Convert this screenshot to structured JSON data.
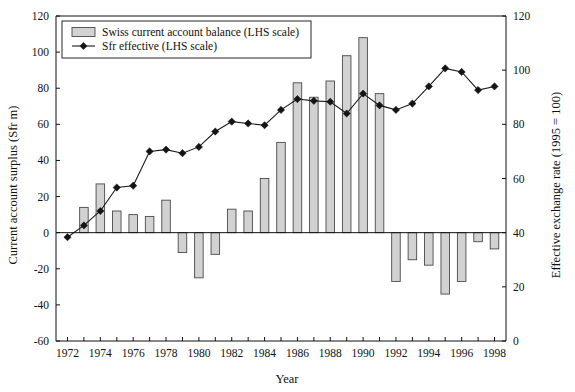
{
  "chart_data": {
    "type": "bar",
    "title": "",
    "xlabel": "Year",
    "ylabel": "Current account surplus (Sfr m)",
    "y2label": "Effective exchange rate (1995 = 100)",
    "grid": false,
    "legend_position": "top-left",
    "xlim": [
      1971.3,
      1998.7
    ],
    "ylim": [
      -60,
      120
    ],
    "y2lim": [
      0,
      120
    ],
    "x_tick_labels": [
      "1972",
      "1974",
      "1976",
      "1978",
      "1980",
      "1982",
      "1984",
      "1986",
      "1988",
      "1990",
      "1992",
      "1994",
      "1996",
      "1998"
    ],
    "x_tick_values": [
      1972,
      1974,
      1976,
      1978,
      1980,
      1982,
      1984,
      1986,
      1988,
      1990,
      1992,
      1994,
      1996,
      1998
    ],
    "y_tick_labels": [
      "120",
      "100",
      "80",
      "60",
      "40",
      "20",
      "0",
      "-20",
      "-40",
      "-60"
    ],
    "y_tick_values": [
      120,
      100,
      80,
      60,
      40,
      20,
      0,
      -20,
      -40,
      -60
    ],
    "y2_tick_labels": [
      "120",
      "100",
      "80",
      "60",
      "40",
      "20",
      "0"
    ],
    "y2_tick_values": [
      120,
      100,
      80,
      60,
      40,
      20,
      0
    ],
    "x": [
      1972,
      1973,
      1974,
      1975,
      1976,
      1977,
      1978,
      1979,
      1980,
      1981,
      1982,
      1983,
      1984,
      1985,
      1986,
      1987,
      1988,
      1989,
      1990,
      1991,
      1992,
      1993,
      1994,
      1995,
      1996,
      1997,
      1998
    ],
    "series": [
      {
        "name": "Swiss current account balance (LHS scale)",
        "type": "bar",
        "color": "#d2d2d2",
        "edge_color": "#4a4a4a",
        "values": [
          0,
          14,
          27,
          12,
          10,
          9,
          18,
          -11,
          -25,
          -12,
          13,
          12,
          30,
          50,
          83,
          75,
          84,
          98,
          108,
          77,
          -27,
          -15,
          -18,
          -34,
          -27,
          -5,
          -9
        ]
      },
      {
        "name": "Sfr effective (LHS scale)",
        "type": "line",
        "color": "#141414",
        "marker": "diamond",
        "values": [
          -2.5,
          4,
          12,
          25,
          26,
          45,
          46,
          44,
          47.5,
          56,
          61.5,
          60.5,
          59.5,
          68,
          74,
          73,
          72.5,
          66,
          77,
          70.5,
          68,
          71.5,
          81,
          91,
          89,
          79,
          81
        ]
      }
    ],
    "legend_entries": [
      "Swiss current account balance (LHS scale)",
      "Sfr effective (LHS scale)"
    ]
  },
  "legend": {
    "bar_label": "Swiss current account balance (LHS scale)",
    "line_label": "Sfr effective (LHS scale)"
  },
  "axes": {
    "left_title": "Current account surplus (Sfr m)",
    "right_title": "Effective exchange rate (1995 = 100)",
    "bottom_title": "Year"
  }
}
